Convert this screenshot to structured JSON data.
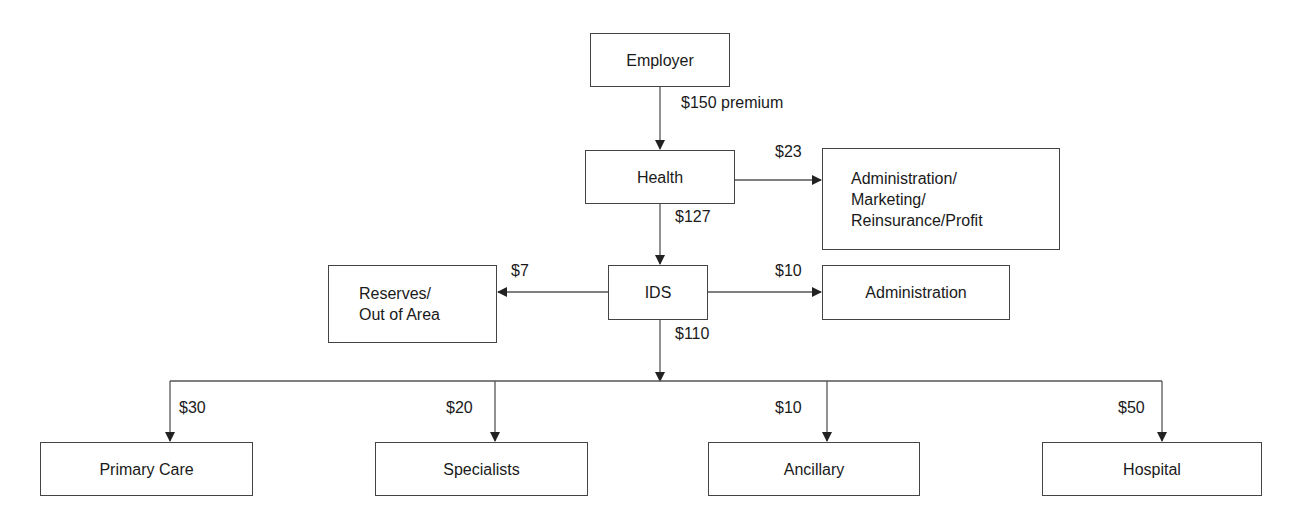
{
  "diagram": {
    "type": "flow",
    "nodes": {
      "employer": {
        "label": "Employer"
      },
      "health": {
        "label": "Health"
      },
      "admin_marketing": {
        "lines": [
          "Administration/",
          "Marketing/",
          "Reinsurance/Profit"
        ]
      },
      "ids": {
        "label": "IDS"
      },
      "reserves": {
        "lines": [
          "Reserves/",
          "Out of Area"
        ]
      },
      "ids_admin": {
        "label": "Administration"
      },
      "primary_care": {
        "label": "Primary Care"
      },
      "specialists": {
        "label": "Specialists"
      },
      "ancillary": {
        "label": "Ancillary"
      },
      "hospital": {
        "label": "Hospital"
      }
    },
    "edges": {
      "employer_to_health": {
        "from": "employer",
        "to": "health",
        "label": "$150 premium"
      },
      "health_to_admin": {
        "from": "health",
        "to": "admin_marketing",
        "label": "$23"
      },
      "health_to_ids": {
        "from": "health",
        "to": "ids",
        "label": "$127"
      },
      "ids_to_reserves": {
        "from": "ids",
        "to": "reserves",
        "label": "$7"
      },
      "ids_to_admin": {
        "from": "ids",
        "to": "ids_admin",
        "label": "$10"
      },
      "ids_to_providers": {
        "from": "ids",
        "to": "providers",
        "label": "$110"
      },
      "to_primary_care": {
        "from": "ids",
        "to": "primary_care",
        "label": "$30"
      },
      "to_specialists": {
        "from": "ids",
        "to": "specialists",
        "label": "$20"
      },
      "to_ancillary": {
        "from": "ids",
        "to": "ancillary",
        "label": "$10"
      },
      "to_hospital": {
        "from": "ids",
        "to": "hospital",
        "label": "$50"
      }
    },
    "colors": {
      "line": "#444444",
      "text": "#1a1a1a",
      "background": "#ffffff"
    }
  }
}
